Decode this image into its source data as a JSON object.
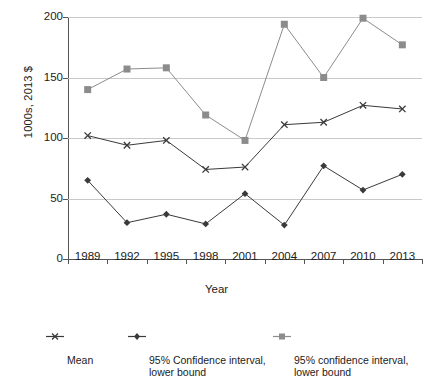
{
  "chart_data": {
    "type": "line",
    "title": "",
    "xlabel": "Year",
    "ylabel": "1000s, 2013 $",
    "categories": [
      "1989",
      "1992",
      "1995",
      "1998",
      "2001",
      "2004",
      "2007",
      "2010",
      "2013"
    ],
    "ylim": [
      0,
      200
    ],
    "yticks": [
      0,
      50,
      100,
      150,
      200
    ],
    "ytick_labels": [
      "0",
      "50",
      "100",
      "150",
      "200"
    ],
    "grid": "horizontal",
    "legend_position": "bottom",
    "series": [
      {
        "name": "Mean",
        "marker": "x",
        "color": "#3a3a3a",
        "values": [
          102,
          94,
          98,
          74,
          76,
          111,
          113,
          127,
          124
        ]
      },
      {
        "name": "95% Confidence interval, lower bound",
        "marker": "diamond",
        "color": "#3a3a3a",
        "values": [
          65,
          30,
          37,
          29,
          54,
          28,
          77,
          57,
          70
        ]
      },
      {
        "name": "95% confidence interval, lower bound",
        "marker": "square",
        "color": "#8c8c8c",
        "values": [
          140,
          157,
          158,
          119,
          98,
          194,
          150,
          199,
          177
        ]
      }
    ]
  },
  "legend": {
    "items": [
      {
        "label": "Mean",
        "marker": "x-marker-icon"
      },
      {
        "label": "95% Confidence interval,\nlower bound",
        "marker": "diamond-marker-icon"
      },
      {
        "label": "95% confidence interval,\nlower bound",
        "marker": "square-marker-icon"
      }
    ]
  },
  "axes": {
    "y_title": "1000s, 2013 $",
    "x_title": "Year"
  }
}
